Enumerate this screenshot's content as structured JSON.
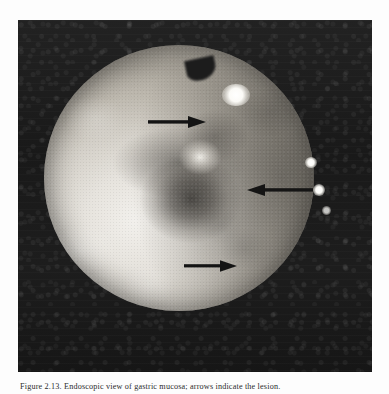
{
  "figure": {
    "kind": "endoscopic-photograph",
    "plate_background_color": "#1a1a1a",
    "page_background_color": "#fdfdfd",
    "annotation_color": "#141414",
    "caption_label": "Figure 2.13.",
    "caption_text": "Figure 2.13.  Endoscopic view of gastric mucosa; arrows indicate the lesion.",
    "arrows": [
      {
        "id": "arrow-top",
        "direction": "right",
        "x": 148,
        "y": 122,
        "length": 58,
        "points_to": "upper mucosal area"
      },
      {
        "id": "arrow-middle",
        "direction": "left",
        "x": 245,
        "y": 190,
        "length": 65,
        "points_to": "central pale nodule"
      },
      {
        "id": "arrow-bottom",
        "direction": "right",
        "x": 185,
        "y": 266,
        "length": 50,
        "points_to": "lower mucosal fold"
      }
    ],
    "highlights": [
      {
        "id": "spec-top",
        "note": "specular light reflection, upper centre"
      },
      {
        "id": "spec-right1",
        "note": "specular light reflection, right rim upper"
      },
      {
        "id": "spec-right2",
        "note": "specular light reflection, right rim middle"
      },
      {
        "id": "spec-right3",
        "note": "specular light reflection, right rim lower"
      }
    ]
  }
}
